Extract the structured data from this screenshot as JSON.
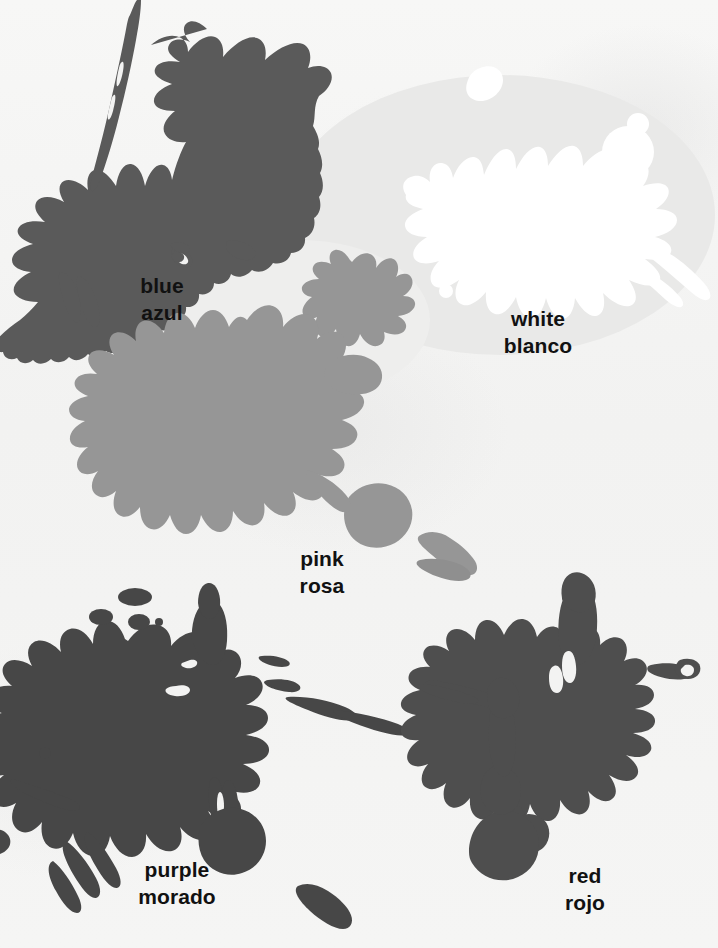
{
  "poster": {
    "title": "Color Splats",
    "background_color": "#f4f4f3",
    "width": 718,
    "height": 948
  },
  "colors": [
    {
      "key": "blue",
      "label_en": "blue",
      "label_es": "azul",
      "swatch_color": "#5a5a5a",
      "label_x": 162,
      "label_y": 272
    },
    {
      "key": "white",
      "label_en": "white",
      "label_es": "blanco",
      "swatch_color": "#ffffff",
      "label_x": 538,
      "label_y": 305
    },
    {
      "key": "pink",
      "label_en": "pink",
      "label_es": "rosa",
      "swatch_color": "#969696",
      "label_x": 322,
      "label_y": 545
    },
    {
      "key": "purple",
      "label_en": "purple",
      "label_es": "morado",
      "swatch_color": "#474747",
      "label_x": 177,
      "label_y": 856
    },
    {
      "key": "red",
      "label_en": "red",
      "label_es": "rojo",
      "swatch_color": "#4e4e4e",
      "label_x": 585,
      "label_y": 862
    }
  ]
}
